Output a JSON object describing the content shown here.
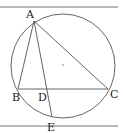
{
  "diagram": {
    "type": "geometry",
    "colors": {
      "stroke": "#555555",
      "label": "#222222",
      "background": "#ffffff"
    },
    "border_lines": [
      {
        "name": "top-rule",
        "x1": 0,
        "y1": 7,
        "x2": 118,
        "y2": 7
      },
      {
        "name": "bottom-rule",
        "x1": 0,
        "y1": 126,
        "x2": 118,
        "y2": 126
      }
    ],
    "circle": {
      "cx": 63,
      "cy": 66,
      "r": 52,
      "center_dot": {
        "x": 63,
        "y": 65
      }
    },
    "points": {
      "A": {
        "label": "A",
        "x": 34,
        "y": 21,
        "lx": 26,
        "ly": 18
      },
      "B": {
        "label": "B",
        "x": 18,
        "y": 89,
        "lx": 12,
        "ly": 101
      },
      "C": {
        "label": "C",
        "x": 108,
        "y": 89,
        "lx": 110,
        "ly": 98
      },
      "D": {
        "label": "D",
        "x": 47,
        "y": 89,
        "lx": 38,
        "ly": 101
      },
      "E": {
        "label": "E",
        "x": 52,
        "y": 117,
        "lx": 47,
        "ly": 131
      }
    },
    "segments": [
      {
        "name": "AB",
        "from": "A",
        "to": "B"
      },
      {
        "name": "AC",
        "from": "A",
        "to": "C"
      },
      {
        "name": "BC",
        "from": "B",
        "to": "C"
      },
      {
        "name": "AE",
        "from": "A",
        "to": "E"
      }
    ]
  }
}
